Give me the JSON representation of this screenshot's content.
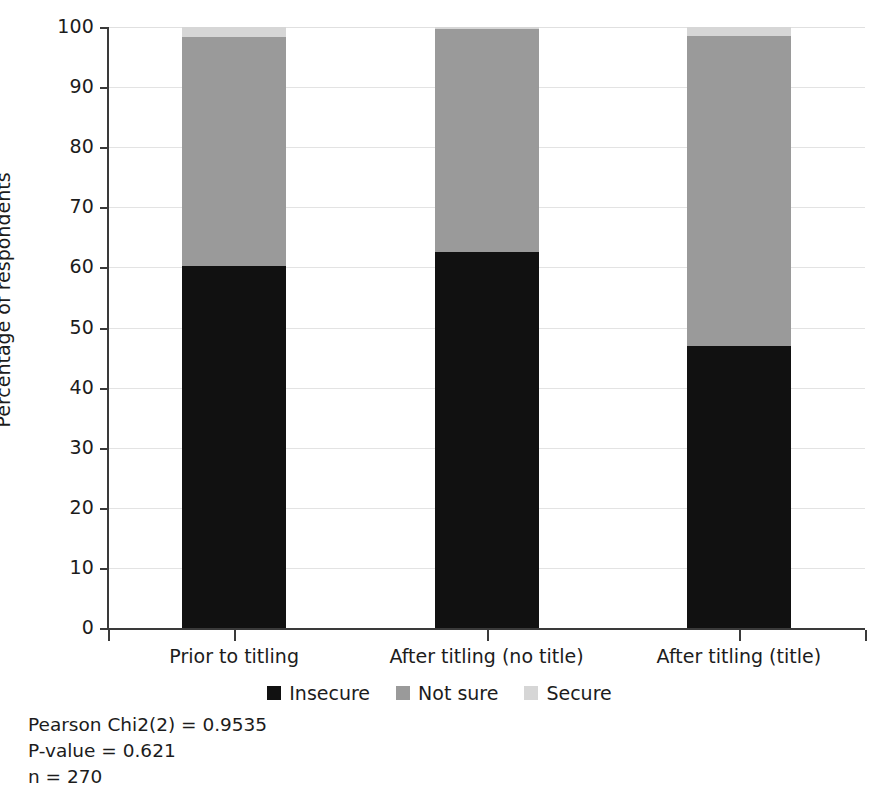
{
  "chart_data": {
    "type": "bar",
    "subtype": "stacked-bar-100",
    "title": "",
    "xlabel": "",
    "ylabel": "Percentage of respondents",
    "ylim": [
      0,
      100
    ],
    "ytick_labels": [
      "0",
      "10",
      "20",
      "30",
      "40",
      "50",
      "60",
      "70",
      "80",
      "90",
      "100"
    ],
    "yticks": [
      0,
      10,
      20,
      30,
      40,
      50,
      60,
      70,
      80,
      90,
      100
    ],
    "grid": true,
    "grid_axis": "y",
    "legend_position": "bottom-center",
    "categories": [
      "Prior to titling",
      "After titling (no title)",
      "After titling (title)"
    ],
    "series": [
      {
        "name": "Insecure",
        "color": "#111111",
        "values": [
          60.2,
          62.6,
          47.0
        ]
      },
      {
        "name": "Not sure",
        "color": "#9a9a9a",
        "values": [
          38.2,
          37.0,
          51.5
        ]
      },
      {
        "name": "Secure",
        "color": "#d6d6d6",
        "values": [
          1.6,
          0.4,
          1.5
        ]
      }
    ],
    "annotations": [
      "Pearson Chi2(2) = 0.9535",
      "P-value = 0.621",
      "n = 270"
    ]
  },
  "legend": {
    "items": [
      {
        "label": "Insecure",
        "color": "#111111"
      },
      {
        "label": "Not sure",
        "color": "#9a9a9a"
      },
      {
        "label": "Secure",
        "color": "#d6d6d6"
      }
    ]
  },
  "footnotes": {
    "chi2": "Pearson Chi2(2) = 0.9535",
    "pvalue": "P-value = 0.621",
    "n": "n = 270"
  },
  "axes": {
    "y_title": "Percentage of respondents",
    "y_labels": [
      "100",
      "90",
      "80",
      "70",
      "60",
      "50",
      "40",
      "30",
      "20",
      "10",
      "0"
    ],
    "x_labels": [
      "Prior to titling",
      "After titling (no title)",
      "After titling (title)"
    ]
  },
  "colors": {
    "insecure": "#111111",
    "not_sure": "#9a9a9a",
    "secure": "#d6d6d6",
    "grid": "#e3e3e3",
    "axis": "#3a3a3a",
    "background": "#ffffff"
  }
}
